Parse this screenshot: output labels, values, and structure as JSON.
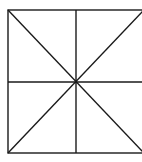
{
  "diagram": {
    "type": "geometric-figure",
    "shape": "square-with-diagonals-and-midlines",
    "stroke_color": "#1a1a1a",
    "background": "#ffffff",
    "square": {
      "x1": 8,
      "y1": 10,
      "x2": 144,
      "y2": 153
    },
    "center": {
      "x": 76,
      "y": 82
    },
    "lines": [
      {
        "name": "diagonal-tl-br",
        "x1": 8,
        "y1": 10,
        "x2": 144,
        "y2": 153
      },
      {
        "name": "diagonal-bl-tr",
        "x1": 8,
        "y1": 153,
        "x2": 144,
        "y2": 10
      },
      {
        "name": "vertical-midline",
        "x1": 76,
        "y1": 10,
        "x2": 76,
        "y2": 153
      },
      {
        "name": "horizontal-midline",
        "x1": 8,
        "y1": 82,
        "x2": 144,
        "y2": 82
      }
    ]
  }
}
